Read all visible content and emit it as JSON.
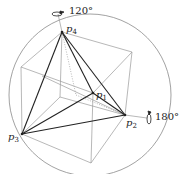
{
  "figure": {
    "labels": {
      "p1": "p",
      "p1_sub": "1",
      "p2": "p",
      "p2_sub": "2",
      "p3": "p",
      "p3_sub": "3",
      "p4": "p",
      "p4_sub": "4"
    },
    "rotations": {
      "top_axis_angle": "120°",
      "right_axis_angle": "180°"
    },
    "colors": {
      "thin_line": "#9a9a9a",
      "thick_line": "#222222",
      "circle": "#8a8a8a"
    }
  }
}
